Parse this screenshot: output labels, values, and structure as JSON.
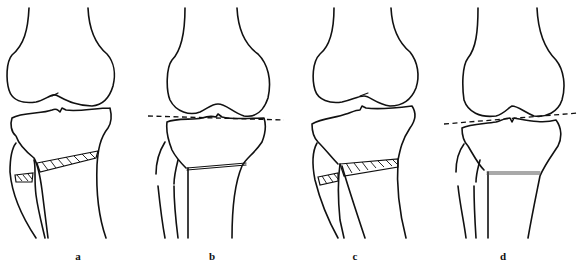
{
  "figure": {
    "panels": [
      {
        "id": "a",
        "label": "a",
        "features": [
          "femur",
          "tibia",
          "fibula",
          "hatched-wedge-tibia",
          "hatched-wedge-fibula"
        ]
      },
      {
        "id": "b",
        "label": "b",
        "features": [
          "femur",
          "tibia",
          "fibula",
          "joint-line-dashed-horizontal",
          "osteotomy-line"
        ]
      },
      {
        "id": "c",
        "label": "c",
        "features": [
          "femur",
          "tibia",
          "fibula",
          "hatched-wedge-tibia",
          "hatched-wedge-fibula"
        ]
      },
      {
        "id": "d",
        "label": "d",
        "features": [
          "femur",
          "tibia",
          "fibula",
          "joint-line-dashed-tilted",
          "osteotomy-line"
        ]
      }
    ],
    "colors": {
      "line": "#111111",
      "background": "#ffffff"
    }
  }
}
